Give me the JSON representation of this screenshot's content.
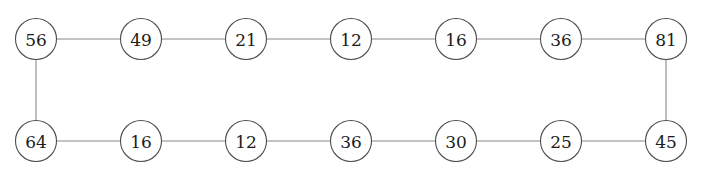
{
  "diagram": {
    "type": "graph",
    "background_color": "#ffffff",
    "edge_color": "#888888",
    "node_stroke_color": "#4d4d4d",
    "node_fill_color": "#ffffff",
    "label_color": "#1c1c1c",
    "node_radius": 20.5,
    "nodes": [
      {
        "id": "n0",
        "label": "56",
        "cx": 36,
        "cy": 39,
        "row": "top",
        "index": 0
      },
      {
        "id": "n1",
        "label": "49",
        "cx": 141,
        "cy": 39,
        "row": "top",
        "index": 1
      },
      {
        "id": "n2",
        "label": "21",
        "cx": 246,
        "cy": 39,
        "row": "top",
        "index": 2
      },
      {
        "id": "n3",
        "label": "12",
        "cx": 351,
        "cy": 39,
        "row": "top",
        "index": 3
      },
      {
        "id": "n4",
        "label": "16",
        "cx": 456,
        "cy": 39,
        "row": "top",
        "index": 4
      },
      {
        "id": "n5",
        "label": "36",
        "cx": 561,
        "cy": 39,
        "row": "top",
        "index": 5
      },
      {
        "id": "n6",
        "label": "81",
        "cx": 666,
        "cy": 39,
        "row": "top",
        "index": 6
      },
      {
        "id": "n7",
        "label": "64",
        "cx": 36,
        "cy": 141,
        "row": "bottom",
        "index": 0
      },
      {
        "id": "n8",
        "label": "16",
        "cx": 141,
        "cy": 141,
        "row": "bottom",
        "index": 1
      },
      {
        "id": "n9",
        "label": "12",
        "cx": 246,
        "cy": 141,
        "row": "bottom",
        "index": 2
      },
      {
        "id": "n10",
        "label": "36",
        "cx": 351,
        "cy": 141,
        "row": "bottom",
        "index": 3
      },
      {
        "id": "n11",
        "label": "30",
        "cx": 456,
        "cy": 141,
        "row": "bottom",
        "index": 4
      },
      {
        "id": "n12",
        "label": "25",
        "cx": 561,
        "cy": 141,
        "row": "bottom",
        "index": 5
      },
      {
        "id": "n13",
        "label": "45",
        "cx": 666,
        "cy": 141,
        "row": "bottom",
        "index": 6
      }
    ],
    "edges": [
      {
        "id": "e0",
        "from": "n0",
        "to": "n1",
        "orientation": "horizontal"
      },
      {
        "id": "e1",
        "from": "n1",
        "to": "n2",
        "orientation": "horizontal"
      },
      {
        "id": "e2",
        "from": "n2",
        "to": "n3",
        "orientation": "horizontal"
      },
      {
        "id": "e3",
        "from": "n3",
        "to": "n4",
        "orientation": "horizontal"
      },
      {
        "id": "e4",
        "from": "n4",
        "to": "n5",
        "orientation": "horizontal"
      },
      {
        "id": "e5",
        "from": "n5",
        "to": "n6",
        "orientation": "horizontal"
      },
      {
        "id": "e6",
        "from": "n6",
        "to": "n13",
        "orientation": "vertical"
      },
      {
        "id": "e7",
        "from": "n7",
        "to": "n8",
        "orientation": "horizontal"
      },
      {
        "id": "e8",
        "from": "n8",
        "to": "n9",
        "orientation": "horizontal"
      },
      {
        "id": "e9",
        "from": "n9",
        "to": "n10",
        "orientation": "horizontal"
      },
      {
        "id": "e10",
        "from": "n10",
        "to": "n11",
        "orientation": "horizontal"
      },
      {
        "id": "e11",
        "from": "n11",
        "to": "n12",
        "orientation": "horizontal"
      },
      {
        "id": "e12",
        "from": "n12",
        "to": "n13",
        "orientation": "horizontal"
      },
      {
        "id": "e13",
        "from": "n0",
        "to": "n7",
        "orientation": "vertical"
      }
    ]
  }
}
